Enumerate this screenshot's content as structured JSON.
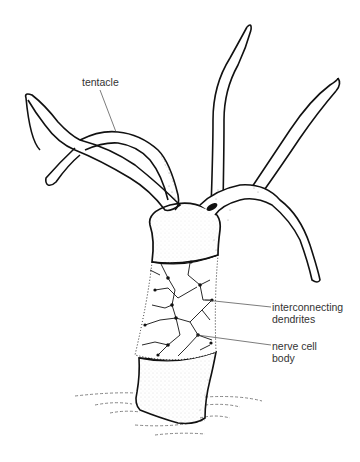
{
  "diagram": {
    "colors": {
      "background": "#ffffff",
      "ink": "#111111",
      "label_text": "#333333",
      "leader_line": "#444444"
    },
    "labels": [
      {
        "id": "tentacle",
        "lines": [
          "tentacle"
        ]
      },
      {
        "id": "dendrites",
        "lines": [
          "interconnecting",
          "dendrites"
        ]
      },
      {
        "id": "nerve_cell",
        "lines": [
          "nerve cell",
          "body"
        ]
      }
    ],
    "parts": [
      "tentacles",
      "hypostome",
      "body column with nerve net",
      "basal disc",
      "substrate"
    ]
  }
}
